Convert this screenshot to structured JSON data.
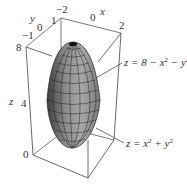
{
  "figure": {
    "type": "3d-surface-plot",
    "surfaces": [
      {
        "name": "upper-paraboloid",
        "equation": "z = 8 − x² − y²",
        "label_parts": [
          "z = 8 − x",
          "2",
          " − y",
          "2"
        ]
      },
      {
        "name": "lower-paraboloid",
        "equation": "z = x² + y²",
        "label_parts": [
          "z = x",
          "2",
          " + y",
          "2"
        ]
      }
    ],
    "axes": {
      "x": {
        "label": "x",
        "ticks": [
          "−2",
          "0",
          "2"
        ]
      },
      "y": {
        "label": "y",
        "ticks": [
          "−1",
          "0",
          "1"
        ]
      },
      "z": {
        "label": "z",
        "ticks": [
          "0",
          "4",
          "8"
        ]
      }
    },
    "colors": {
      "surface": "#8a8a8a",
      "surface_dark": "#4a4a4a",
      "mesh": "#222222",
      "box": "#444444"
    }
  }
}
